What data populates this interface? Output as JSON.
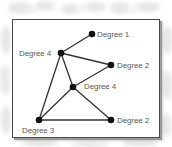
{
  "diagram": {
    "type": "undirected-graph",
    "colors": {
      "node": "#111111",
      "edge": "#333333",
      "label": "#5a5a5a",
      "frame": "#4a4a4a",
      "background_texture": "#e6e6e6"
    },
    "nodes": [
      {
        "id": "A",
        "label": "Degree 1",
        "x": 92,
        "y": 34,
        "label_x": 97,
        "label_y": 29.5
      },
      {
        "id": "B",
        "label": "Degree 4",
        "x": 61,
        "y": 53,
        "label_x": 19,
        "label_y": 48.5
      },
      {
        "id": "C",
        "label": "Degree 2",
        "x": 111,
        "y": 65,
        "label_x": 117,
        "label_y": 60.5
      },
      {
        "id": "D",
        "label": "Degree 4",
        "x": 73,
        "y": 87,
        "label_x": 84,
        "label_y": 82
      },
      {
        "id": "E",
        "label": "Degree 3",
        "x": 39,
        "y": 120,
        "label_x": 22,
        "label_y": 126
      },
      {
        "id": "F",
        "label": "Degree 2",
        "x": 111,
        "y": 120,
        "label_x": 117,
        "label_y": 115.5
      }
    ],
    "edges": [
      {
        "from": "A",
        "to": "B"
      },
      {
        "from": "B",
        "to": "C"
      },
      {
        "from": "B",
        "to": "D"
      },
      {
        "from": "B",
        "to": "E"
      },
      {
        "from": "C",
        "to": "D"
      },
      {
        "from": "D",
        "to": "E"
      },
      {
        "from": "D",
        "to": "F"
      },
      {
        "from": "E",
        "to": "F"
      }
    ]
  },
  "labels": {
    "degree_1": "Degree 1",
    "degree_4_top": "Degree 4",
    "degree_2_right": "Degree 2",
    "degree_4_center": "Degree 4",
    "degree_3": "Degree 3",
    "degree_2_bottom": "Degree 2"
  }
}
